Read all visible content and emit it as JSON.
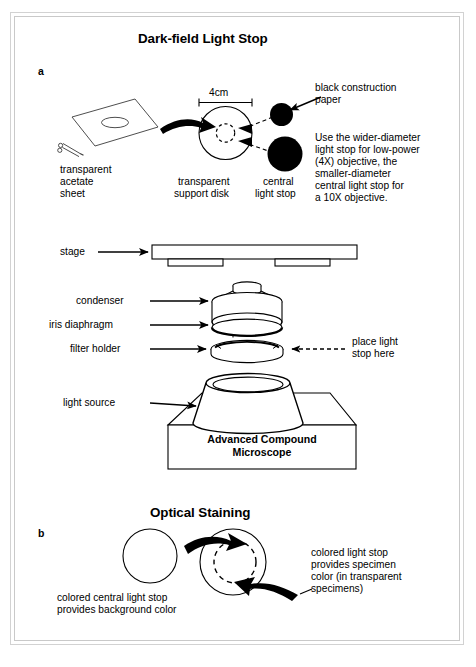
{
  "figure": {
    "background": "#ffffff",
    "frame_color": "#d2d2d2",
    "ink": "#000000"
  },
  "panel_a": {
    "letter": "a",
    "title": "Dark-field Light Stop",
    "acetate_label": "transparent\nacetate\nsheet",
    "acetate_label_lines": [
      "transparent",
      "acetate",
      "sheet"
    ],
    "dimension": "4cm",
    "disk_label_lines": [
      "transparent",
      "support disk"
    ],
    "stop_label_lines": [
      "central",
      "light stop"
    ],
    "paper_label_lines": [
      "black construction",
      "paper"
    ],
    "instruction": "Use the wider-diameter light stop for low-power (4X) objective, the smaller-diameter central light stop for a 10X objective.",
    "instruction_lines": [
      "Use the wider-diameter",
      "light stop for low-power",
      "(4X) objective, the",
      "smaller-diameter",
      "central light stop for",
      "a 10X objective."
    ]
  },
  "microscope": {
    "labels": {
      "stage": "stage",
      "condenser": "condenser",
      "iris_diaphragm": "iris diaphragm",
      "filter_holder": "filter holder",
      "light_source": "light source"
    },
    "callout_lines": [
      "place light",
      "stop here"
    ],
    "base_caption_lines": [
      "Advanced Compound",
      "Microscope"
    ]
  },
  "panel_b": {
    "letter": "b",
    "title": "Optical Staining",
    "left_caption_lines": [
      "colored central light stop",
      "provides background color"
    ],
    "right_caption_lines": [
      "colored light stop",
      "provides specimen",
      "color (in transparent",
      "specimens)"
    ]
  }
}
